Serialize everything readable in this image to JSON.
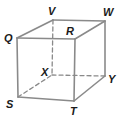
{
  "diagram": {
    "type": "rectangular prism (cube) with hidden edges dashed",
    "colors": {
      "edge": "#8a8a8a",
      "label": "#1a1a1a",
      "background": "#ffffff"
    },
    "vertices": {
      "Q": {
        "label": "Q",
        "x": 17,
        "y": 38
      },
      "R": {
        "label": "R",
        "x": 75,
        "y": 39
      },
      "S": {
        "label": "S",
        "x": 18,
        "y": 97
      },
      "T": {
        "label": "T",
        "x": 74,
        "y": 101
      },
      "V": {
        "label": "V",
        "x": 53,
        "y": 20
      },
      "W": {
        "label": "W",
        "x": 105,
        "y": 21
      },
      "X": {
        "label": "X",
        "x": 52,
        "y": 75
      },
      "Y": {
        "label": "Y",
        "x": 105,
        "y": 76
      }
    },
    "solid_edges": [
      "QR",
      "QS",
      "RT",
      "ST",
      "QV",
      "VW",
      "RW",
      "WY",
      "TY"
    ],
    "hidden_edges": [
      "VX",
      "XY",
      "SX"
    ]
  }
}
